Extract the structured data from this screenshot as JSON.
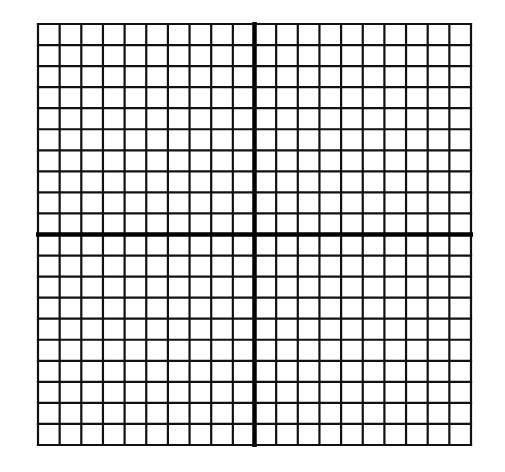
{
  "diagram": {
    "type": "coordinate-grid",
    "columns": 20,
    "rows": 20,
    "x_axis_at_row": 10,
    "y_axis_at_column": 10,
    "line_color": "#111111",
    "axis_color": "#000000",
    "background": "#ffffff"
  }
}
